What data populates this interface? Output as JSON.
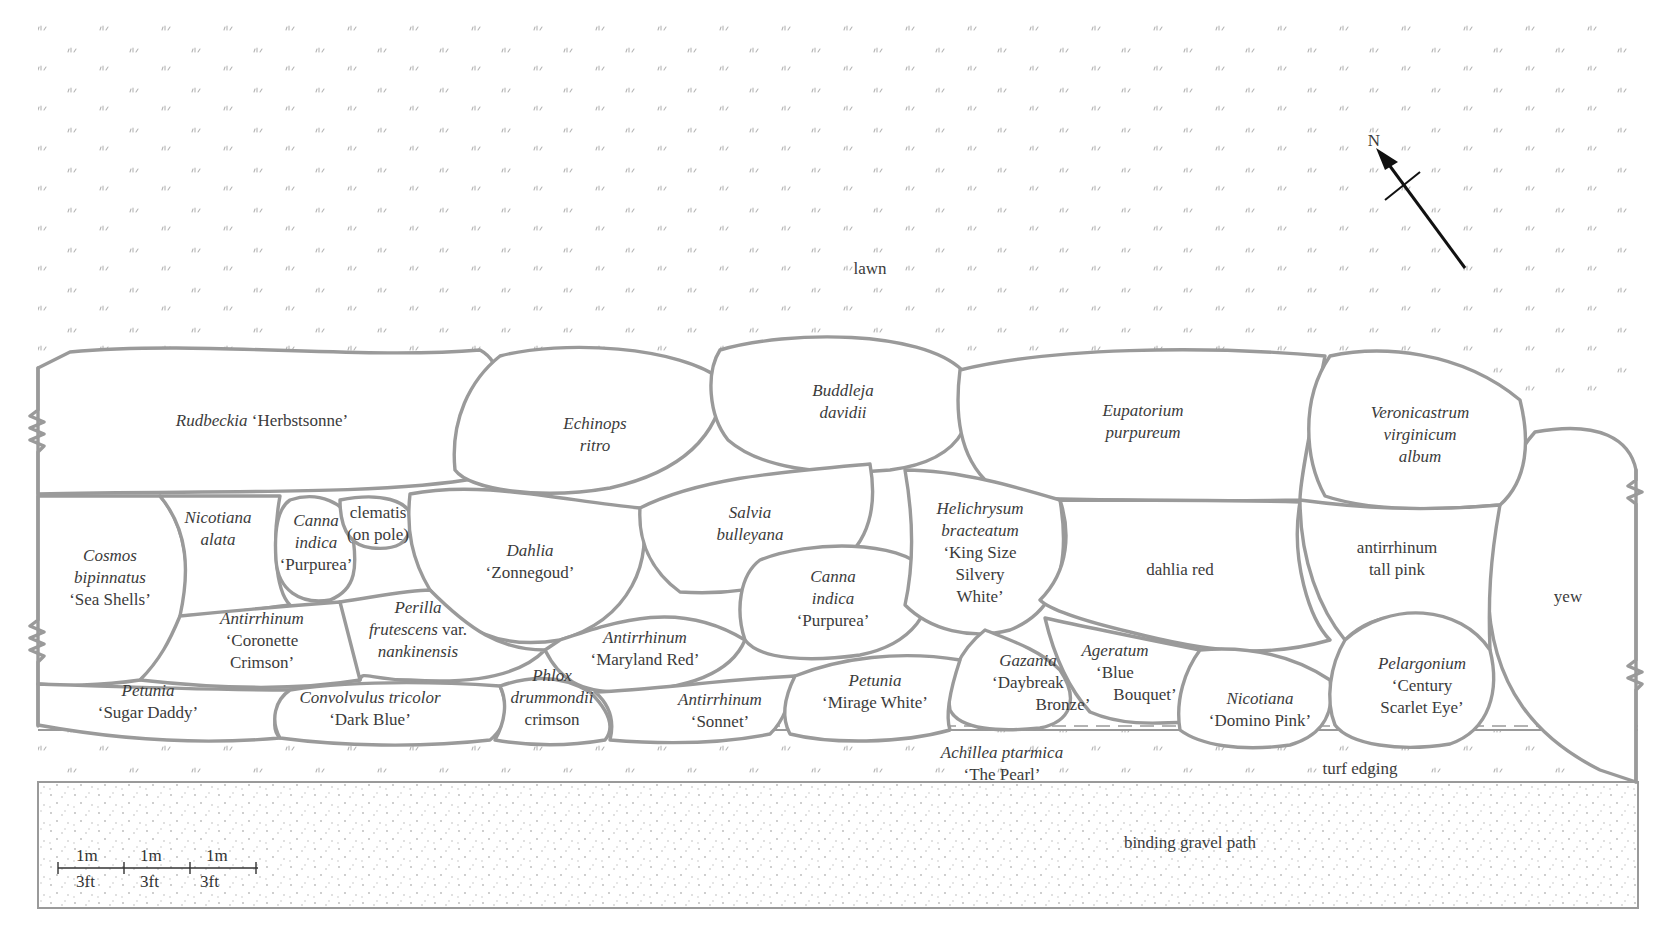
{
  "areas": {
    "lawn": "lawn",
    "turf_edging": "turf edging",
    "gravel_path": "binding gravel path",
    "yew": "yew"
  },
  "compass": {
    "north_label": "N"
  },
  "scale_bar": {
    "metric": [
      "1m",
      "1m",
      "1m"
    ],
    "imperial": [
      "3ft",
      "3ft",
      "3ft"
    ]
  },
  "plants": {
    "rudbeckia": {
      "genus": "Rudbeckia",
      "cultivar": "‘Herbstsonne’"
    },
    "echinops": {
      "line1": "Echinops",
      "line2": "ritro"
    },
    "buddleja": {
      "line1": "Buddleja",
      "line2": "davidii"
    },
    "eupatorium": {
      "line1": "Eupatorium",
      "line2": "purpureum"
    },
    "veronicastrum": {
      "line1": "Veronicastrum",
      "line2": "virginicum",
      "line3": "album"
    },
    "cosmos": {
      "line1": "Cosmos",
      "line2": "bipinnatus",
      "line3": "‘Sea Shells’"
    },
    "nicotiana_alata": {
      "line1": "Nicotiana",
      "line2": "alata"
    },
    "canna_left": {
      "line1": "Canna",
      "line2": "indica",
      "line3": "‘Purpurea’"
    },
    "clematis": {
      "line1": "clematis",
      "line2": "(on pole)"
    },
    "dahlia_zonnegoud": {
      "line1": "Dahlia",
      "line2": "‘Zonnegoud’"
    },
    "salvia": {
      "line1": "Salvia",
      "line2": "bulleyana"
    },
    "canna_right": {
      "line1": "Canna",
      "line2": "indica",
      "line3": "‘Purpurea’"
    },
    "helichrysum": {
      "line1": "Helichrysum",
      "line2": "bracteatum",
      "line3": "‘King Size",
      "line4": "Silvery",
      "line5": "White’"
    },
    "dahlia_red": {
      "line1": "dahlia red"
    },
    "antirrhinum_tall_pink": {
      "line1": "antirrhinum",
      "line2": "tall pink"
    },
    "antirrhinum_coronette": {
      "line1": "Antirrhinum",
      "line2": "‘Coronette",
      "line3": "Crimson’"
    },
    "perilla": {
      "line1": "Perilla",
      "line2_it": "frutescens",
      "line2_rm": "var.",
      "line3": "nankinensis"
    },
    "antirrhinum_maryland": {
      "line1": "Antirrhinum",
      "line2": "‘Maryland Red’"
    },
    "petunia_sugar": {
      "line1": "Petunia",
      "line2": "‘Sugar Daddy’"
    },
    "convolvulus": {
      "line1": "Convolvulus tricolor",
      "line2": "‘Dark Blue’"
    },
    "phlox": {
      "line1": "Phlox",
      "line2": "drummondii",
      "line3": "crimson"
    },
    "antirrhinum_sonnet": {
      "line1": "Antirrhinum",
      "line2": "‘Sonnet’"
    },
    "petunia_mirage": {
      "line1": "Petunia",
      "line2": "‘Mirage White’"
    },
    "gazania": {
      "line1": "Gazania",
      "line2": "‘Daybreak",
      "line3": "Bronze’"
    },
    "ageratum": {
      "line1": "Ageratum",
      "line2": "‘Blue",
      "line3": "Bouquet’"
    },
    "nicotiana_domino": {
      "line1": "Nicotiana",
      "line2": "‘Domino Pink’"
    },
    "pelargonium": {
      "line1": "Pelargonium",
      "line2": "‘Century",
      "line3": "Scarlet Eye’"
    },
    "achillea": {
      "line1": "Achillea ptarmica",
      "line2": "‘The Pearl’"
    }
  },
  "colors": {
    "outline": "#9a9a9a",
    "text": "#3b3b3b",
    "background": "#ffffff",
    "grass_marks": "#b0b0b0",
    "gravel_dots": "#b8b8b8"
  }
}
